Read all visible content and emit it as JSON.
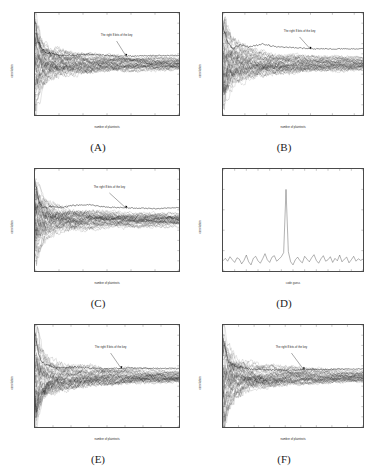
{
  "figure": {
    "background_color": "#ffffff",
    "axis_color": "#4a4a4a",
    "trace_color": "#1a1a1a",
    "panel_count": 6
  },
  "chart_data": [
    {
      "type": "line",
      "panel": "A",
      "caption": "(A)",
      "title": "",
      "xlabel": "number of plaintexts",
      "ylabel": "correlation",
      "xlim": [
        0,
        3000
      ],
      "ylim": [
        -0.5,
        0.5
      ],
      "xticks": [
        0,
        500,
        1000,
        1500,
        2000,
        2500,
        3000
      ],
      "yticks": [
        -0.5,
        -0.4,
        -0.3,
        -0.2,
        -0.1,
        0,
        0.1,
        0.2,
        0.3,
        0.4,
        0.5
      ],
      "grid": false,
      "legend": "none",
      "annotation": "The right 8 bits of the key",
      "annotation_x": 1700,
      "annotation_y": 0.26,
      "arrow_tip_x": 1900,
      "arrow_tip_y": 0.075,
      "series_count": 256,
      "noise_envelope": [
        {
          "x": 0,
          "y": 0.5
        },
        {
          "x": 60,
          "y": 0.3
        },
        {
          "x": 150,
          "y": 0.19
        },
        {
          "x": 300,
          "y": 0.135
        },
        {
          "x": 600,
          "y": 0.1
        },
        {
          "x": 1000,
          "y": 0.082
        },
        {
          "x": 1500,
          "y": 0.068
        },
        {
          "x": 2000,
          "y": 0.06
        },
        {
          "x": 2500,
          "y": 0.054
        },
        {
          "x": 3000,
          "y": 0.05
        }
      ],
      "correct_key_trace": [
        {
          "x": 0,
          "y": 0.42
        },
        {
          "x": 80,
          "y": 0.2
        },
        {
          "x": 200,
          "y": 0.12
        },
        {
          "x": 500,
          "y": 0.085
        },
        {
          "x": 800,
          "y": 0.082
        },
        {
          "x": 1100,
          "y": 0.098
        },
        {
          "x": 1400,
          "y": 0.088
        },
        {
          "x": 1800,
          "y": 0.076
        },
        {
          "x": 2200,
          "y": 0.08
        },
        {
          "x": 2600,
          "y": 0.084
        },
        {
          "x": 3000,
          "y": 0.082
        }
      ]
    },
    {
      "type": "line",
      "panel": "B",
      "caption": "(B)",
      "title": "",
      "xlabel": "number of plaintexts",
      "ylabel": "correlation",
      "xlim": [
        0,
        3200
      ],
      "ylim": [
        -0.5,
        0.5
      ],
      "xticks": [
        0,
        500,
        1000,
        1500,
        2000,
        2500,
        3000,
        3200
      ],
      "yticks": [
        -0.5,
        -0.4,
        -0.3,
        -0.2,
        -0.1,
        0,
        0.1,
        0.2,
        0.3,
        0.4,
        0.5
      ],
      "grid": false,
      "legend": "none",
      "annotation": "The right 8 bits of the key",
      "annotation_x": 1750,
      "annotation_y": 0.3,
      "arrow_tip_x": 2000,
      "arrow_tip_y": 0.145,
      "series_count": 256,
      "noise_envelope": [
        {
          "x": 0,
          "y": 0.5
        },
        {
          "x": 60,
          "y": 0.33
        },
        {
          "x": 150,
          "y": 0.22
        },
        {
          "x": 300,
          "y": 0.16
        },
        {
          "x": 600,
          "y": 0.115
        },
        {
          "x": 1000,
          "y": 0.09
        },
        {
          "x": 1500,
          "y": 0.075
        },
        {
          "x": 2000,
          "y": 0.066
        },
        {
          "x": 2600,
          "y": 0.058
        },
        {
          "x": 3200,
          "y": 0.053
        }
      ],
      "correct_key_trace": [
        {
          "x": 0,
          "y": 0.4
        },
        {
          "x": 100,
          "y": 0.2
        },
        {
          "x": 250,
          "y": 0.155
        },
        {
          "x": 400,
          "y": 0.185
        },
        {
          "x": 600,
          "y": 0.165
        },
        {
          "x": 900,
          "y": 0.195
        },
        {
          "x": 1200,
          "y": 0.17
        },
        {
          "x": 1600,
          "y": 0.16
        },
        {
          "x": 2000,
          "y": 0.15
        },
        {
          "x": 2500,
          "y": 0.148
        },
        {
          "x": 3200,
          "y": 0.15
        }
      ]
    },
    {
      "type": "line",
      "panel": "C",
      "caption": "(C)",
      "title": "",
      "xlabel": "number of plaintexts",
      "ylabel": "correlation",
      "xlim": [
        0,
        3000
      ],
      "ylim": [
        -0.5,
        0.5
      ],
      "xticks": [
        0,
        500,
        1000,
        1500,
        2000,
        2500,
        3000
      ],
      "yticks": [
        -0.5,
        -0.4,
        -0.3,
        -0.2,
        -0.1,
        0,
        0.1,
        0.2,
        0.3,
        0.4,
        0.5
      ],
      "grid": false,
      "legend": "none",
      "annotation": "The right 8 bits of the key",
      "annotation_x": 1550,
      "annotation_y": 0.3,
      "arrow_tip_x": 1900,
      "arrow_tip_y": 0.115,
      "series_count": 256,
      "noise_envelope": [
        {
          "x": 0,
          "y": 0.45
        },
        {
          "x": 60,
          "y": 0.28
        },
        {
          "x": 150,
          "y": 0.185
        },
        {
          "x": 300,
          "y": 0.13
        },
        {
          "x": 600,
          "y": 0.098
        },
        {
          "x": 1000,
          "y": 0.08
        },
        {
          "x": 1500,
          "y": 0.068
        },
        {
          "x": 2000,
          "y": 0.06
        },
        {
          "x": 2500,
          "y": 0.055
        },
        {
          "x": 3000,
          "y": 0.052
        }
      ],
      "correct_key_trace": [
        {
          "x": 0,
          "y": 0.38
        },
        {
          "x": 90,
          "y": 0.155
        },
        {
          "x": 200,
          "y": 0.115
        },
        {
          "x": 350,
          "y": 0.135
        },
        {
          "x": 550,
          "y": 0.12
        },
        {
          "x": 800,
          "y": 0.142
        },
        {
          "x": 1100,
          "y": 0.15
        },
        {
          "x": 1500,
          "y": 0.125
        },
        {
          "x": 2000,
          "y": 0.118
        },
        {
          "x": 2500,
          "y": 0.112
        },
        {
          "x": 3000,
          "y": 0.122
        }
      ]
    },
    {
      "type": "line",
      "panel": "D",
      "caption": "(D)",
      "title": "",
      "xlabel": "code guess",
      "ylabel": "correlation",
      "xlim": [
        0,
        60
      ],
      "ylim": [
        0,
        0.5
      ],
      "xticks": [
        0,
        5,
        10,
        15,
        20,
        25,
        30,
        35,
        40,
        45,
        50,
        55,
        60
      ],
      "yticks": [
        0,
        0.1,
        0.2,
        0.3,
        0.4,
        0.5
      ],
      "grid": false,
      "legend": "none",
      "annotation": "",
      "series_count": 1,
      "peak_x": 27,
      "peak_y": 0.4,
      "baseline_mean": 0.055,
      "baseline_noise": 0.03,
      "values": [
        {
          "x": 0,
          "y": 0.05
        },
        {
          "x": 1,
          "y": 0.062
        },
        {
          "x": 2,
          "y": 0.048
        },
        {
          "x": 3,
          "y": 0.07
        },
        {
          "x": 4,
          "y": 0.055
        },
        {
          "x": 5,
          "y": 0.042
        },
        {
          "x": 6,
          "y": 0.065
        },
        {
          "x": 7,
          "y": 0.058
        },
        {
          "x": 8,
          "y": 0.035
        },
        {
          "x": 9,
          "y": 0.052
        },
        {
          "x": 10,
          "y": 0.078
        },
        {
          "x": 11,
          "y": 0.045
        },
        {
          "x": 12,
          "y": 0.03
        },
        {
          "x": 13,
          "y": 0.062
        },
        {
          "x": 14,
          "y": 0.072
        },
        {
          "x": 15,
          "y": 0.05
        },
        {
          "x": 16,
          "y": 0.038
        },
        {
          "x": 17,
          "y": 0.06
        },
        {
          "x": 18,
          "y": 0.085
        },
        {
          "x": 19,
          "y": 0.055
        },
        {
          "x": 20,
          "y": 0.042
        },
        {
          "x": 21,
          "y": 0.068
        },
        {
          "x": 22,
          "y": 0.075
        },
        {
          "x": 23,
          "y": 0.048
        },
        {
          "x": 24,
          "y": 0.058
        },
        {
          "x": 25,
          "y": 0.07
        },
        {
          "x": 26,
          "y": 0.09
        },
        {
          "x": 27,
          "y": 0.4
        },
        {
          "x": 28,
          "y": 0.095
        },
        {
          "x": 29,
          "y": 0.045
        },
        {
          "x": 30,
          "y": 0.03
        },
        {
          "x": 31,
          "y": 0.055
        },
        {
          "x": 32,
          "y": 0.068
        },
        {
          "x": 33,
          "y": 0.05
        },
        {
          "x": 34,
          "y": 0.04
        },
        {
          "x": 35,
          "y": 0.072
        },
        {
          "x": 36,
          "y": 0.058
        },
        {
          "x": 37,
          "y": 0.045
        },
        {
          "x": 38,
          "y": 0.065
        },
        {
          "x": 39,
          "y": 0.08
        },
        {
          "x": 40,
          "y": 0.052
        },
        {
          "x": 41,
          "y": 0.038
        },
        {
          "x": 42,
          "y": 0.06
        },
        {
          "x": 43,
          "y": 0.075
        },
        {
          "x": 44,
          "y": 0.048
        },
        {
          "x": 45,
          "y": 0.055
        },
        {
          "x": 46,
          "y": 0.07
        },
        {
          "x": 47,
          "y": 0.042
        },
        {
          "x": 48,
          "y": 0.062
        },
        {
          "x": 49,
          "y": 0.05
        },
        {
          "x": 50,
          "y": 0.078
        },
        {
          "x": 51,
          "y": 0.045
        },
        {
          "x": 52,
          "y": 0.058
        },
        {
          "x": 53,
          "y": 0.068
        },
        {
          "x": 54,
          "y": 0.04
        },
        {
          "x": 55,
          "y": 0.055
        },
        {
          "x": 56,
          "y": 0.072
        },
        {
          "x": 57,
          "y": 0.048
        },
        {
          "x": 58,
          "y": 0.06
        },
        {
          "x": 59,
          "y": 0.052
        },
        {
          "x": 60,
          "y": 0.058
        }
      ]
    },
    {
      "type": "line",
      "panel": "E",
      "caption": "(E)",
      "title": "",
      "xlabel": "number of plaintexts",
      "ylabel": "correlation",
      "xlim": [
        0,
        4000
      ],
      "ylim": [
        -0.5,
        0.5
      ],
      "xticks": [
        0,
        500,
        1000,
        1500,
        2000,
        2500,
        3000,
        3500,
        4000
      ],
      "yticks": [
        -0.5,
        -0.4,
        -0.3,
        -0.2,
        -0.1,
        0,
        0.1,
        0.2,
        0.3,
        0.4,
        0.5
      ],
      "grid": false,
      "legend": "none",
      "annotation": "The right 8 bits of the key",
      "annotation_x": 2100,
      "annotation_y": 0.26,
      "arrow_tip_x": 2400,
      "arrow_tip_y": 0.072,
      "series_count": 256,
      "noise_envelope": [
        {
          "x": 0,
          "y": 0.5
        },
        {
          "x": 80,
          "y": 0.3
        },
        {
          "x": 200,
          "y": 0.195
        },
        {
          "x": 400,
          "y": 0.145
        },
        {
          "x": 800,
          "y": 0.105
        },
        {
          "x": 1300,
          "y": 0.085
        },
        {
          "x": 2000,
          "y": 0.07
        },
        {
          "x": 2700,
          "y": 0.06
        },
        {
          "x": 3400,
          "y": 0.054
        },
        {
          "x": 4000,
          "y": 0.05
        }
      ],
      "correct_key_trace": [
        {
          "x": 0,
          "y": 0.4
        },
        {
          "x": 120,
          "y": 0.175
        },
        {
          "x": 300,
          "y": 0.105
        },
        {
          "x": 600,
          "y": 0.082
        },
        {
          "x": 1000,
          "y": 0.09
        },
        {
          "x": 1500,
          "y": 0.078
        },
        {
          "x": 2000,
          "y": 0.072
        },
        {
          "x": 2600,
          "y": 0.08
        },
        {
          "x": 3200,
          "y": 0.076
        },
        {
          "x": 4000,
          "y": 0.074
        }
      ]
    },
    {
      "type": "line",
      "panel": "F",
      "caption": "(F)",
      "title": "",
      "xlabel": "number of plaintexts",
      "ylabel": "correlation",
      "xlim": [
        0,
        4500
      ],
      "ylim": [
        -0.5,
        0.5
      ],
      "xticks": [
        0,
        500,
        1000,
        1500,
        2000,
        2500,
        3000,
        3500,
        4000,
        4500
      ],
      "yticks": [
        -0.5,
        -0.4,
        -0.3,
        -0.2,
        -0.1,
        0,
        0.1,
        0.2,
        0.3,
        0.4,
        0.5
      ],
      "grid": false,
      "legend": "none",
      "annotation": "The right 8 bits of the key",
      "annotation_x": 2200,
      "annotation_y": 0.26,
      "arrow_tip_x": 2600,
      "arrow_tip_y": 0.06,
      "series_count": 256,
      "noise_envelope": [
        {
          "x": 0,
          "y": 0.5
        },
        {
          "x": 80,
          "y": 0.32
        },
        {
          "x": 200,
          "y": 0.215
        },
        {
          "x": 450,
          "y": 0.15
        },
        {
          "x": 900,
          "y": 0.108
        },
        {
          "x": 1500,
          "y": 0.085
        },
        {
          "x": 2200,
          "y": 0.07
        },
        {
          "x": 3000,
          "y": 0.06
        },
        {
          "x": 3800,
          "y": 0.052
        },
        {
          "x": 4500,
          "y": 0.048
        }
      ],
      "correct_key_trace": [
        {
          "x": 0,
          "y": 0.38
        },
        {
          "x": 150,
          "y": 0.15
        },
        {
          "x": 400,
          "y": 0.095
        },
        {
          "x": 800,
          "y": 0.07
        },
        {
          "x": 1300,
          "y": 0.062
        },
        {
          "x": 1900,
          "y": 0.058
        },
        {
          "x": 2500,
          "y": 0.06
        },
        {
          "x": 3200,
          "y": 0.064
        },
        {
          "x": 3900,
          "y": 0.068
        },
        {
          "x": 4500,
          "y": 0.07
        }
      ]
    }
  ]
}
